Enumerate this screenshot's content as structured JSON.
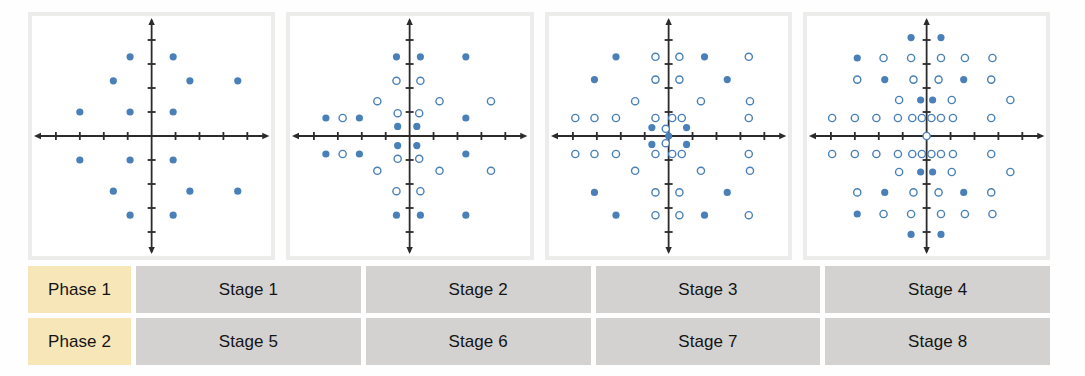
{
  "figure": {
    "title": "",
    "panel_border_color": "#ececeb",
    "marker_filled_color": "#4a80b8",
    "marker_hollow_stroke": "#4a80b8",
    "axis_color": "#2b2b2b",
    "phase_cell_color": "#f7e6b8",
    "stage_cell_color": "#d3d2d0",
    "corner_block_color": "#e9e9e7"
  },
  "table": {
    "rows": [
      {
        "phase": "Phase 1",
        "stages": [
          "Stage 1",
          "Stage 2",
          "Stage 3",
          "Stage 4"
        ]
      },
      {
        "phase": "Phase 2",
        "stages": [
          "Stage 5",
          "Stage 6",
          "Stage 7",
          "Stage 8"
        ]
      }
    ]
  },
  "chart_data": [
    {
      "type": "scatter",
      "title": "Stage 1",
      "name": "constellation-stage-1",
      "xlabel": "In-phase (I)",
      "ylabel": "Quadrature (Q)",
      "xlim": [
        -5,
        5
      ],
      "ylim": [
        -5,
        5
      ],
      "grid": false,
      "legend": [
        "filled"
      ],
      "axis_ticks_x": [
        -4,
        -3,
        -2,
        -1,
        1,
        2,
        3,
        4
      ],
      "axis_ticks_y": [
        -4,
        -3,
        -2,
        -1,
        1,
        2,
        3,
        4
      ],
      "series": [
        {
          "name": "filled",
          "marker": "filled-circle",
          "points": [
            [
              -3,
              1
            ],
            [
              -3,
              -1
            ],
            [
              -1.6,
              2.3
            ],
            [
              -1.6,
              -2.3
            ],
            [
              -0.9,
              3.3
            ],
            [
              -0.9,
              -3.3
            ],
            [
              -0.9,
              1
            ],
            [
              -0.9,
              -1
            ],
            [
              0.9,
              3.3
            ],
            [
              0.9,
              -3.3
            ],
            [
              0.9,
              1
            ],
            [
              0.9,
              -1
            ],
            [
              1.6,
              2.3
            ],
            [
              1.6,
              -2.3
            ],
            [
              3.6,
              2.3
            ],
            [
              3.6,
              -2.3
            ]
          ]
        }
      ]
    },
    {
      "type": "scatter",
      "title": "Stage 2",
      "name": "constellation-stage-2",
      "xlabel": "In-phase (I)",
      "ylabel": "Quadrature (Q)",
      "xlim": [
        -5,
        5
      ],
      "ylim": [
        -5,
        5
      ],
      "grid": false,
      "legend": [
        "filled",
        "hollow"
      ],
      "axis_ticks_x": [
        -4,
        -3,
        -2,
        -1,
        1,
        2,
        3,
        4
      ],
      "axis_ticks_y": [
        -4,
        -3,
        -2,
        -1,
        1,
        2,
        3,
        4
      ],
      "series": [
        {
          "name": "filled",
          "marker": "filled-circle",
          "points": [
            [
              -3.5,
              0.75
            ],
            [
              -3.5,
              -0.75
            ],
            [
              -2.1,
              0.75
            ],
            [
              -2.1,
              -0.75
            ],
            [
              -0.5,
              0.4
            ],
            [
              -0.5,
              -0.4
            ],
            [
              0.3,
              0.4
            ],
            [
              0.3,
              -0.4
            ],
            [
              -0.55,
              3.3
            ],
            [
              -0.55,
              -3.3
            ],
            [
              0.45,
              3.3
            ],
            [
              0.45,
              -3.3
            ],
            [
              2.35,
              3.3
            ],
            [
              2.35,
              -3.3
            ],
            [
              2.35,
              0.75
            ],
            [
              2.35,
              -0.75
            ]
          ]
        },
        {
          "name": "hollow",
          "marker": "hollow-circle",
          "points": [
            [
              -2.8,
              0.75
            ],
            [
              -2.8,
              -0.75
            ],
            [
              -0.55,
              2.3
            ],
            [
              -0.55,
              -2.3
            ],
            [
              0.45,
              2.3
            ],
            [
              0.45,
              -2.3
            ],
            [
              -1.35,
              1.45
            ],
            [
              -1.35,
              -1.45
            ],
            [
              1.25,
              1.45
            ],
            [
              1.25,
              -1.45
            ],
            [
              3.4,
              1.45
            ],
            [
              3.4,
              -1.45
            ],
            [
              -0.5,
              0.95
            ],
            [
              -0.5,
              -0.95
            ],
            [
              0.4,
              0.95
            ],
            [
              0.4,
              -0.95
            ]
          ]
        }
      ]
    },
    {
      "type": "scatter",
      "title": "Stage 3",
      "name": "constellation-stage-3",
      "xlabel": "In-phase (I)",
      "ylabel": "Quadrature (Q)",
      "xlim": [
        -5,
        5
      ],
      "ylim": [
        -5,
        5
      ],
      "grid": false,
      "legend": [
        "filled",
        "hollow"
      ],
      "axis_ticks_x": [
        -4,
        -3,
        -2,
        -1,
        1,
        2,
        3,
        4
      ],
      "axis_ticks_y": [
        -4,
        -3,
        -2,
        -1,
        1,
        2,
        3,
        4
      ],
      "series": [
        {
          "name": "filled",
          "marker": "filled-circle",
          "points": [
            [
              -2.2,
              3.3
            ],
            [
              -2.2,
              -3.3
            ],
            [
              1.5,
              3.3
            ],
            [
              1.5,
              -3.3
            ],
            [
              -3.1,
              2.35
            ],
            [
              -3.1,
              -2.35
            ],
            [
              2.45,
              2.35
            ],
            [
              2.45,
              -2.35
            ],
            [
              -0.7,
              0.35
            ],
            [
              -0.7,
              -0.35
            ],
            [
              0.75,
              0.35
            ],
            [
              0.75,
              -0.35
            ],
            [
              0,
              0
            ]
          ]
        },
        {
          "name": "hollow",
          "marker": "hollow-circle",
          "points": [
            [
              -0.55,
              3.3
            ],
            [
              -0.55,
              -3.3
            ],
            [
              0.45,
              3.3
            ],
            [
              0.45,
              -3.3
            ],
            [
              3.35,
              3.3
            ],
            [
              3.35,
              -3.3
            ],
            [
              -0.55,
              2.35
            ],
            [
              -0.55,
              -2.35
            ],
            [
              0.45,
              2.35
            ],
            [
              0.45,
              -2.35
            ],
            [
              -1.4,
              1.45
            ],
            [
              -1.4,
              -1.45
            ],
            [
              1.35,
              1.45
            ],
            [
              1.35,
              -1.45
            ],
            [
              3.4,
              1.45
            ],
            [
              3.4,
              -1.45
            ],
            [
              -3.9,
              0.75
            ],
            [
              -3.9,
              -0.75
            ],
            [
              -3.1,
              0.75
            ],
            [
              -3.1,
              -0.75
            ],
            [
              -2.2,
              0.75
            ],
            [
              -2.2,
              -0.75
            ],
            [
              -0.55,
              0.75
            ],
            [
              -0.55,
              -0.75
            ],
            [
              0.15,
              0.75
            ],
            [
              0.15,
              -0.75
            ],
            [
              0.55,
              0.75
            ],
            [
              0.55,
              -0.75
            ],
            [
              3.35,
              0.75
            ],
            [
              3.35,
              -0.75
            ],
            [
              -0.12,
              0.3
            ],
            [
              -0.12,
              -0.3
            ]
          ]
        }
      ]
    },
    {
      "type": "scatter",
      "title": "Stage 4",
      "name": "constellation-stage-4",
      "xlabel": "In-phase (I)",
      "ylabel": "Quadrature (Q)",
      "xlim": [
        -5,
        5
      ],
      "ylim": [
        -5,
        5
      ],
      "grid": false,
      "legend": [
        "filled",
        "hollow"
      ],
      "axis_ticks_x": [
        -4,
        -3,
        -2,
        -1,
        1,
        2,
        3,
        4
      ],
      "axis_ticks_y": [
        -4,
        -3,
        -2,
        -1,
        1,
        2,
        3,
        4
      ],
      "series": [
        {
          "name": "filled",
          "marker": "filled-circle",
          "points": [
            [
              -0.65,
              4.1
            ],
            [
              -0.65,
              -4.1
            ],
            [
              0.6,
              4.1
            ],
            [
              0.6,
              -4.1
            ],
            [
              -2.9,
              3.25
            ],
            [
              -2.9,
              -3.25
            ],
            [
              -1.75,
              2.35
            ],
            [
              -1.75,
              -2.35
            ],
            [
              1.55,
              2.35
            ],
            [
              1.55,
              -2.35
            ],
            [
              -0.25,
              1.5
            ],
            [
              -0.25,
              -1.5
            ],
            [
              0.25,
              1.5
            ],
            [
              0.25,
              -1.5
            ]
          ]
        },
        {
          "name": "hollow",
          "marker": "hollow-circle",
          "points": [
            [
              -1.8,
              3.25
            ],
            [
              -1.8,
              -3.25
            ],
            [
              -0.65,
              3.25
            ],
            [
              -0.65,
              -3.25
            ],
            [
              0.6,
              3.25
            ],
            [
              0.6,
              -3.25
            ],
            [
              1.6,
              3.25
            ],
            [
              1.6,
              -3.25
            ],
            [
              2.75,
              3.25
            ],
            [
              2.75,
              -3.25
            ],
            [
              -2.9,
              2.35
            ],
            [
              -2.9,
              -2.35
            ],
            [
              -0.55,
              2.35
            ],
            [
              -0.55,
              -2.35
            ],
            [
              0.5,
              2.35
            ],
            [
              0.5,
              -2.35
            ],
            [
              2.7,
              2.35
            ],
            [
              2.7,
              -2.35
            ],
            [
              -1.15,
              1.5
            ],
            [
              -1.15,
              -1.5
            ],
            [
              1.05,
              1.5
            ],
            [
              1.05,
              -1.5
            ],
            [
              3.5,
              1.5
            ],
            [
              3.5,
              -1.5
            ],
            [
              -3.95,
              0.75
            ],
            [
              -3.95,
              -0.75
            ],
            [
              -3.0,
              0.75
            ],
            [
              -3.0,
              -0.75
            ],
            [
              -2.1,
              0.75
            ],
            [
              -2.1,
              -0.75
            ],
            [
              -1.2,
              0.75
            ],
            [
              -1.2,
              -0.75
            ],
            [
              -0.6,
              0.75
            ],
            [
              -0.6,
              -0.75
            ],
            [
              -0.2,
              0.75
            ],
            [
              -0.2,
              -0.75
            ],
            [
              0.2,
              0.75
            ],
            [
              0.2,
              -0.75
            ],
            [
              0.6,
              0.75
            ],
            [
              0.6,
              -0.75
            ],
            [
              1.1,
              0.75
            ],
            [
              1.1,
              -0.75
            ],
            [
              2.7,
              0.75
            ],
            [
              2.7,
              -0.75
            ],
            [
              0,
              0
            ]
          ]
        }
      ]
    }
  ]
}
